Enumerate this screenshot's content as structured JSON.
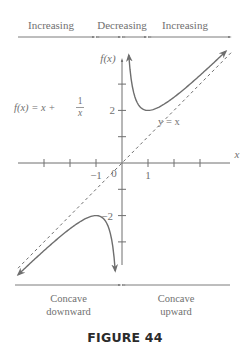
{
  "chart_data": {
    "type": "line",
    "title": "",
    "function_label": "f(x) = x + 1/x",
    "function_label_parts": {
      "lhs": "f(x) = x + ",
      "num": "1",
      "den": "x"
    },
    "xlabel": "x",
    "ylabel": "f(x)",
    "xlim": [
      -4.3,
      4.3
    ],
    "ylim": [
      -3.9,
      4.1
    ],
    "x_ticks": [
      -3,
      -2,
      -1,
      1,
      2,
      3
    ],
    "x_tick_labels": [
      {
        "value": -1,
        "text": "−1"
      },
      {
        "value": 1,
        "text": "1"
      }
    ],
    "y_ticks": [
      -3,
      -2,
      -1,
      1,
      2,
      3
    ],
    "y_tick_labels": [
      {
        "value": 2,
        "text": "2"
      },
      {
        "value": -2,
        "text": "−2"
      }
    ],
    "origin_label": "0",
    "series": [
      {
        "name": "f(x) = x + 1/x (x > 0)",
        "style": "solid",
        "x_range": [
          0.26,
          4.0
        ],
        "arrows": "both"
      },
      {
        "name": "f(x) = x + 1/x (x < 0)",
        "style": "solid",
        "x_range": [
          -4.0,
          -0.26
        ],
        "arrows": "both"
      },
      {
        "name": "y = x",
        "label": "y = x",
        "style": "dashed",
        "x_range": [
          -4.3,
          4.3
        ]
      }
    ],
    "key_points": [
      {
        "x": 1,
        "y": 2,
        "type": "local minimum"
      },
      {
        "x": -1,
        "y": -2,
        "type": "local maximum"
      }
    ],
    "monotonicity": {
      "labels": [
        "Increasing",
        "Decreasing",
        "Increasing"
      ],
      "breakpoints": [
        -1,
        0,
        1
      ]
    },
    "concavity": {
      "labels": [
        "Concave\ndownward",
        "Concave\nupward"
      ],
      "label_lines": [
        [
          "Concave",
          "downward"
        ],
        [
          "Concave",
          "upward"
        ]
      ],
      "breakpoints": [
        0
      ]
    }
  },
  "caption": "FIGURE 44"
}
